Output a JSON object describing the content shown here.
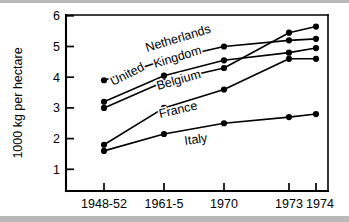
{
  "chart_data": {
    "type": "line",
    "title": "",
    "xlabel": "",
    "ylabel": "1000 kg per hectare",
    "categories": [
      "1948-52",
      "1961-5",
      "1970",
      "1973",
      "1974"
    ],
    "yticks": [
      "1",
      "2",
      "3",
      "4",
      "5",
      "6"
    ],
    "ylim": [
      0,
      6
    ],
    "grid": false,
    "legend_position": "inline-labels",
    "marker": "filled-circle",
    "line_color": "#000000",
    "background_color": "#ffffff",
    "series": [
      {
        "name": "Netherlands",
        "values": [
          3.9,
          4.55,
          5.0,
          5.2,
          5.25
        ]
      },
      {
        "name": "United Kingdom",
        "values": [
          3.2,
          4.05,
          4.55,
          4.8,
          4.95
        ]
      },
      {
        "name": "Belgium",
        "values": [
          3.0,
          3.85,
          4.3,
          5.45,
          5.65
        ]
      },
      {
        "name": "France",
        "values": [
          1.8,
          3.0,
          3.6,
          4.6,
          4.6
        ]
      },
      {
        "name": "Italy",
        "values": [
          1.6,
          2.15,
          2.5,
          2.7,
          2.8
        ]
      }
    ],
    "annotations": [
      {
        "text": "Netherlands",
        "rotation": -17
      },
      {
        "text": "United",
        "rotation": -27
      },
      {
        "text": "Kingdom",
        "rotation": -17
      },
      {
        "text": "Belgium",
        "rotation": -16
      },
      {
        "text": "France",
        "rotation": -13
      },
      {
        "text": "Italy",
        "rotation": -8
      }
    ]
  }
}
